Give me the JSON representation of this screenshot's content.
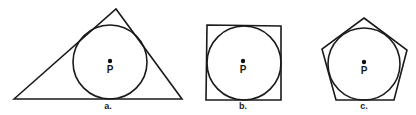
{
  "figure": {
    "panels": [
      {
        "id": "a",
        "caption": "a.",
        "shape": "triangle",
        "center_label": "P",
        "polygon_points": "14,99 116,9 182,99",
        "circle": {
          "cx": 110,
          "cy": 62,
          "r": 37
        },
        "dot": {
          "cx": 110,
          "cy": 61
        },
        "label_pos": {
          "x": 110,
          "y": 73
        },
        "caption_pos": {
          "x": 108,
          "y": 109
        }
      },
      {
        "id": "b",
        "caption": "b.",
        "shape": "square",
        "center_label": "P",
        "polygon_points": "207,25 281,26 281,100 206,100",
        "circle": {
          "cx": 244,
          "cy": 63,
          "r": 37
        },
        "dot": {
          "cx": 243,
          "cy": 61
        },
        "label_pos": {
          "x": 243,
          "y": 73
        },
        "caption_pos": {
          "x": 243,
          "y": 109
        }
      },
      {
        "id": "c",
        "caption": "c.",
        "shape": "pentagon",
        "center_label": "P",
        "polygon_points": "364,18 407,50 394,100 336,100 322,49",
        "circle": {
          "cx": 364,
          "cy": 64,
          "r": 36
        },
        "dot": {
          "cx": 364,
          "cy": 62
        },
        "label_pos": {
          "x": 364,
          "y": 74
        },
        "caption_pos": {
          "x": 364,
          "y": 109
        }
      }
    ],
    "colors": {
      "stroke": "#1a1a1a",
      "background": "#ffffff"
    }
  }
}
